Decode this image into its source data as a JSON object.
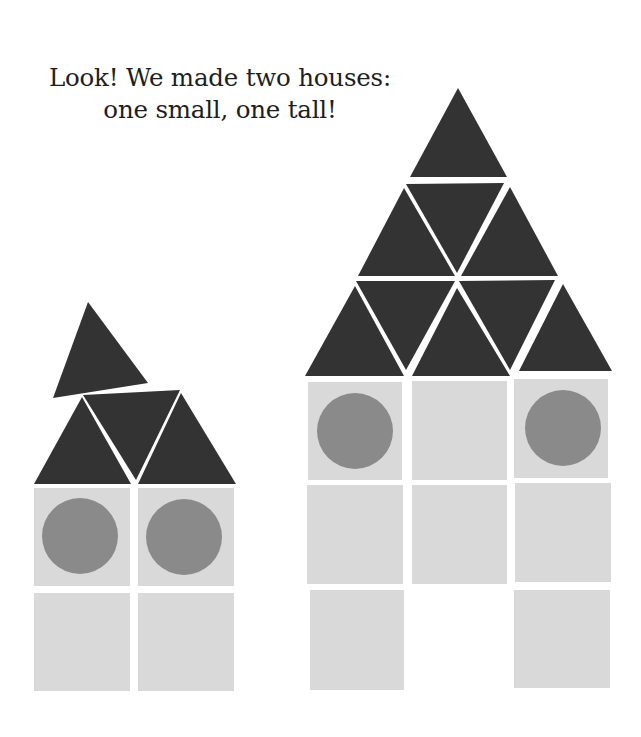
{
  "caption": {
    "line1": "Look! We made two houses:",
    "line2": "one small, one tall!"
  },
  "colors": {
    "triangle": "#333333",
    "square": "#d9d9d9",
    "circle": "#8a8a8a",
    "background": "#ffffff",
    "text": "#1e1e1e"
  },
  "houses": [
    {
      "name": "small-house",
      "triangles": [
        "53,398 148,383 88,302",
        "34,484 82,397 131,484",
        "83,395 180,390 136,480",
        "138,484 181,393 236,484"
      ],
      "squares": [
        [
          34,
          488,
          96,
          98
        ],
        [
          138,
          488,
          96,
          98
        ],
        [
          34,
          593,
          96,
          98
        ],
        [
          138,
          593,
          96,
          98
        ]
      ],
      "circles": [
        [
          80,
          536,
          38
        ],
        [
          184,
          537,
          38
        ]
      ]
    },
    {
      "name": "tall-house",
      "triangles": [
        "410,177 458,88 507,177",
        "406,184 504,183 457,273",
        "358,276 404,188 455,276",
        "461,276 510,187 558,276",
        "356,281 455,281 406,370",
        "459,281 555,280 510,370",
        "305,376 355,286 404,376",
        "412,376 457,288 510,376",
        "519,371 563,284 612,371"
      ],
      "squares": [
        [
          308,
          382,
          94,
          98
        ],
        [
          412,
          381,
          95,
          99
        ],
        [
          514,
          379,
          94,
          99
        ],
        [
          307,
          485,
          96,
          99
        ],
        [
          412,
          485,
          95,
          99
        ],
        [
          515,
          483,
          96,
          99
        ],
        [
          310,
          590,
          94,
          100
        ],
        [
          514,
          590,
          96,
          98
        ]
      ],
      "circles": [
        [
          355,
          431,
          38
        ],
        [
          563,
          428,
          38
        ]
      ]
    }
  ]
}
